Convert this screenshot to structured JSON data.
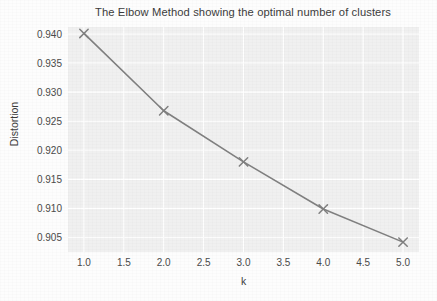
{
  "chart_data": {
    "type": "line",
    "title": "The Elbow Method showing the optimal number of clusters",
    "xlabel": "k",
    "ylabel": "Distortion",
    "x": [
      1,
      2,
      3,
      4,
      5
    ],
    "values": [
      0.9401,
      0.9268,
      0.918,
      0.9099,
      0.9042
    ],
    "series": [
      {
        "name": "Distortion",
        "x": [
          1,
          2,
          3,
          4,
          5
        ],
        "values": [
          0.9401,
          0.9268,
          0.918,
          0.9099,
          0.9042
        ]
      }
    ],
    "xlim": [
      0.8,
      5.2
    ],
    "ylim": [
      0.9025,
      0.9412
    ],
    "xticks": [
      "1.0",
      "1.5",
      "2.0",
      "2.5",
      "3.0",
      "3.5",
      "4.0",
      "4.5",
      "5.0"
    ],
    "xtick_values": [
      1.0,
      1.5,
      2.0,
      2.5,
      3.0,
      3.5,
      4.0,
      4.5,
      5.0
    ],
    "yticks": [
      "0.905",
      "0.910",
      "0.915",
      "0.920",
      "0.925",
      "0.930",
      "0.935",
      "0.940"
    ],
    "ytick_values": [
      0.905,
      0.91,
      0.915,
      0.92,
      0.925,
      0.93,
      0.935,
      0.94
    ],
    "grid": true,
    "grid_color": "#ffffff",
    "panel_color": "#f0f0f0",
    "line_color": "#808080",
    "marker": "x",
    "marker_color": "#808080",
    "legend": null,
    "legend_position": "none"
  }
}
